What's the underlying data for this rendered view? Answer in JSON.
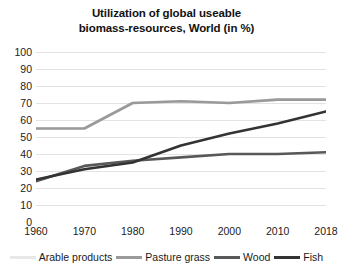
{
  "chart_data": {
    "type": "line",
    "title": "Utilization of global useable biomass-resources, World (in %)",
    "title_lines": [
      "Utilization of global useable",
      "biomass-resources, World (in %)"
    ],
    "xlabel": "",
    "ylabel": "",
    "categories": [
      "1960",
      "1970",
      "1980",
      "1990",
      "2000",
      "2010",
      "2018"
    ],
    "x": [
      1960,
      1970,
      1980,
      1990,
      2000,
      2010,
      2018
    ],
    "ylim": [
      0,
      100
    ],
    "yticks": [
      0,
      10,
      20,
      30,
      40,
      50,
      60,
      70,
      80,
      90,
      100
    ],
    "ytick_labels": [
      "0",
      "10",
      "20",
      "30",
      "40",
      "50",
      "60",
      "70",
      "80",
      "90",
      "100"
    ],
    "grid": true,
    "grid_axis": "y",
    "legend_position": "bottom",
    "series": [
      {
        "name": "Arable products",
        "color": "#e8e8e8",
        "values": [
          55,
          55,
          70,
          71,
          70,
          72,
          72
        ]
      },
      {
        "name": "Pasture grass",
        "color": "#9a9a9a",
        "values": [
          55,
          55,
          70,
          71,
          70,
          72,
          72
        ]
      },
      {
        "name": "Wood",
        "color": "#585858",
        "values": [
          24,
          33,
          36,
          38,
          40,
          40,
          41
        ]
      },
      {
        "name": "Fish",
        "color": "#333333",
        "values": [
          25,
          31,
          35,
          45,
          52,
          58,
          65
        ]
      }
    ]
  },
  "legend": {
    "items": [
      {
        "label": "Arable products",
        "color": "#e8e8e8"
      },
      {
        "label": "Pasture grass",
        "color": "#9a9a9a"
      },
      {
        "label": "Wood",
        "color": "#585858"
      },
      {
        "label": "Fish",
        "color": "#333333"
      }
    ]
  },
  "colors": {
    "background": "#ffffff",
    "gridline": "#e3e3e3",
    "axis_text": "#222222",
    "title_text": "#111111"
  }
}
